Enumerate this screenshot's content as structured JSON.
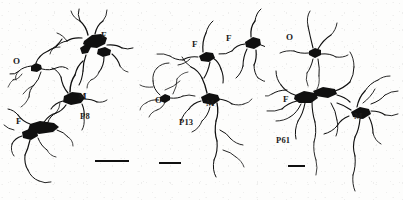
{
  "figure": {
    "background_color": "#fdfdfc",
    "ink_color": "#101010",
    "panel_count": 3
  },
  "panels": [
    {
      "id": "panel-p8",
      "age_label": "P8",
      "age_pos": {
        "x": 80,
        "y": 112
      },
      "scalebar": {
        "x": 95,
        "y": 160,
        "width": 34,
        "height": 2
      },
      "cell_labels": [
        {
          "text": "O",
          "x": 13,
          "y": 57
        },
        {
          "text": "F",
          "x": 101,
          "y": 31
        },
        {
          "text": "M",
          "x": 78,
          "y": 92
        },
        {
          "text": "F",
          "x": 16,
          "y": 117
        }
      ]
    },
    {
      "id": "panel-p13",
      "age_label": "P13",
      "age_pos": {
        "x": 179,
        "y": 118
      },
      "scalebar": {
        "x": 159,
        "y": 162,
        "width": 22,
        "height": 2
      },
      "cell_labels": [
        {
          "text": "F",
          "x": 192,
          "y": 40
        },
        {
          "text": "F",
          "x": 226,
          "y": 34
        },
        {
          "text": "O",
          "x": 155,
          "y": 96
        },
        {
          "text": "M",
          "x": 206,
          "y": 99
        }
      ]
    },
    {
      "id": "panel-p61",
      "age_label": "P61",
      "age_pos": {
        "x": 276,
        "y": 136
      },
      "scalebar": {
        "x": 288,
        "y": 165,
        "width": 17,
        "height": 2
      },
      "cell_labels": [
        {
          "text": "O",
          "x": 286,
          "y": 33
        },
        {
          "text": "F",
          "x": 283,
          "y": 95
        },
        {
          "text": "M",
          "x": 354,
          "y": 112
        }
      ]
    }
  ],
  "legend_keys": {
    "O": "oligodendrocyte-cell-label",
    "F": "fibrous-astrocyte-cell-label",
    "M": "multipolar-astrocyte-cell-label"
  }
}
